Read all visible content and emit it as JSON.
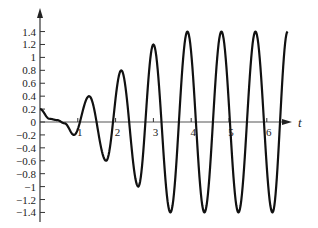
{
  "chart_data": {
    "type": "line",
    "title": "",
    "xlabel": "t",
    "ylabel": "",
    "xlim": [
      0,
      6.6
    ],
    "ylim": [
      -1.5,
      1.6
    ],
    "grid": false,
    "legend": null,
    "x_ticks": [
      1,
      2,
      3,
      4,
      5,
      6
    ],
    "y_ticks": [
      1.4,
      1.2,
      1,
      0.8,
      0.6,
      0.4,
      0.2,
      0,
      -0.2,
      -0.4,
      -0.6,
      -0.8,
      -1,
      -1.2,
      -1.4
    ],
    "y_tick_labels": [
      "1.4",
      "1.2",
      "1",
      "0.8",
      "0.6",
      "0.4",
      "0.2",
      "0",
      "−0.2",
      "−0.4",
      "−0.6",
      "−0.8",
      "−1",
      "−1.2",
      "−1.4"
    ],
    "x_tick_labels": [
      "1",
      "2",
      "3",
      "4",
      "5",
      "6"
    ],
    "series": [
      {
        "name": "response",
        "color": "#111111",
        "description": "Oscillation with growing amplitude that saturates at ±1.4",
        "x": [
          0,
          0.25,
          0.45,
          0.65,
          0.9,
          1.3,
          1.75,
          2.15,
          2.6,
          3.0,
          3.45,
          3.9,
          4.35,
          4.8,
          5.25,
          5.7,
          6.15,
          6.55
        ],
        "values": [
          0.2,
          0.05,
          0.03,
          -0.02,
          -0.2,
          0.4,
          -0.6,
          0.8,
          -1.0,
          1.2,
          -1.4,
          1.4,
          -1.4,
          1.4,
          -1.4,
          1.4,
          -1.4,
          1.4
        ]
      }
    ]
  }
}
